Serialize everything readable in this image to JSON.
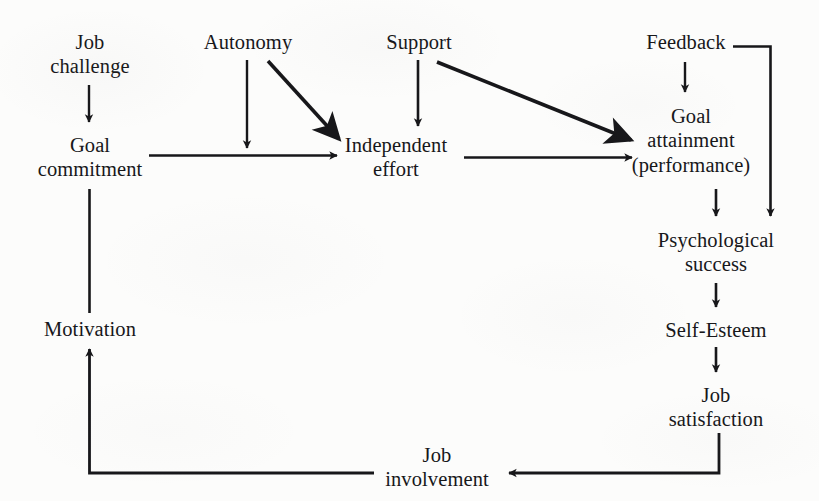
{
  "diagram": {
    "type": "flow-diagram",
    "background_color": "#fcfcfb",
    "ink_color": "#17171a",
    "nodes": [
      {
        "id": "job-challenge",
        "lines": [
          "Job",
          "challenge"
        ],
        "x": 90,
        "y": 30
      },
      {
        "id": "goal-commitment",
        "lines": [
          "Goal",
          "commitment"
        ],
        "x": 90,
        "y": 133
      },
      {
        "id": "autonomy",
        "lines": [
          "Autonomy"
        ],
        "x": 248,
        "y": 30
      },
      {
        "id": "support",
        "lines": [
          "Support"
        ],
        "x": 419,
        "y": 30
      },
      {
        "id": "independent-effort",
        "lines": [
          "Independent",
          "effort"
        ],
        "x": 396,
        "y": 133
      },
      {
        "id": "feedback",
        "lines": [
          "Feedback"
        ],
        "x": 686,
        "y": 30
      },
      {
        "id": "goal-attainment",
        "lines": [
          "Goal",
          "attainment",
          "(performance)"
        ],
        "x": 691,
        "y": 104
      },
      {
        "id": "psychological-success",
        "lines": [
          "Psychological",
          "success"
        ],
        "x": 716,
        "y": 228
      },
      {
        "id": "self-esteem",
        "lines": [
          "Self-Esteem"
        ],
        "x": 716,
        "y": 318
      },
      {
        "id": "job-satisfaction",
        "lines": [
          "Job",
          "satisfaction"
        ],
        "x": 716,
        "y": 383
      },
      {
        "id": "job-involvement",
        "lines": [
          "Job",
          "involvement"
        ],
        "x": 437,
        "y": 443
      },
      {
        "id": "motivation",
        "lines": [
          "Motivation"
        ],
        "x": 90,
        "y": 317
      }
    ],
    "edges": [
      {
        "id": "job-challenge-to-goal-commitment",
        "from": "job-challenge",
        "to": "goal-commitment",
        "shape": "vertical"
      },
      {
        "id": "goal-commitment-to-independent-effort",
        "from": "goal-commitment",
        "to": "independent-effort",
        "shape": "horizontal"
      },
      {
        "id": "autonomy-to-independent-effort-vertical",
        "from": "autonomy",
        "to": "independent-effort",
        "shape": "vertical"
      },
      {
        "id": "autonomy-to-independent-effort-diagonal",
        "from": "autonomy",
        "to": "independent-effort",
        "shape": "diagonal"
      },
      {
        "id": "support-to-independent-effort",
        "from": "support",
        "to": "independent-effort",
        "shape": "vertical"
      },
      {
        "id": "support-to-goal-attainment",
        "from": "support",
        "to": "goal-attainment",
        "shape": "diagonal"
      },
      {
        "id": "independent-effort-to-goal-attainment",
        "from": "independent-effort",
        "to": "goal-attainment",
        "shape": "horizontal"
      },
      {
        "id": "feedback-to-goal-attainment",
        "from": "feedback",
        "to": "goal-attainment",
        "shape": "vertical"
      },
      {
        "id": "feedback-to-psychological-success",
        "from": "feedback",
        "to": "psychological-success",
        "shape": "elbow"
      },
      {
        "id": "goal-attainment-to-psychological-success",
        "from": "goal-attainment",
        "to": "psychological-success",
        "shape": "vertical"
      },
      {
        "id": "psychological-success-to-self-esteem",
        "from": "psychological-success",
        "to": "self-esteem",
        "shape": "vertical"
      },
      {
        "id": "self-esteem-to-job-satisfaction",
        "from": "self-esteem",
        "to": "job-satisfaction",
        "shape": "vertical"
      },
      {
        "id": "job-satisfaction-to-job-involvement",
        "from": "job-satisfaction",
        "to": "job-involvement",
        "shape": "elbow"
      },
      {
        "id": "job-involvement-to-motivation",
        "from": "job-involvement",
        "to": "motivation",
        "shape": "elbow"
      },
      {
        "id": "motivation-to-goal-commitment",
        "from": "motivation",
        "to": "goal-commitment",
        "shape": "vertical"
      }
    ]
  }
}
